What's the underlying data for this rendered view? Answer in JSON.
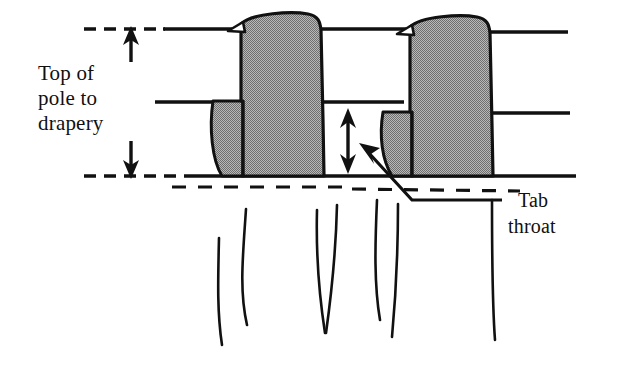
{
  "figure": {
    "title": "Drapery tab on pole — dimension diagram",
    "background_color": "#ffffff",
    "line_color": "#111111",
    "fill_color": "#9a9a9a",
    "labels": {
      "top_of_pole": {
        "line1": "Top of",
        "line2": "pole to",
        "line3": "drapery"
      },
      "tab_throat": {
        "line1": "Tab",
        "line2": "throat"
      }
    },
    "annotations": {
      "dimension_top_of_pole_to_drapery": "double arrow between upper dashed line and lower dashed line",
      "dimension_tab_throat": "double arrow between middle pole line and bottom pole line",
      "leader_tab_throat": "diagonal leader from tab throat gap to Tab throat text"
    },
    "elements": {
      "pole_top_line": "dashed-to-solid horizontal line",
      "pole_middle_line": "solid horizontal line",
      "pole_bottom_line": "dashed-to-solid horizontal line",
      "drapery_top_edge": "dashed horizontal line below pole",
      "tab_count": 2,
      "drapery_fold_count": 7
    }
  }
}
